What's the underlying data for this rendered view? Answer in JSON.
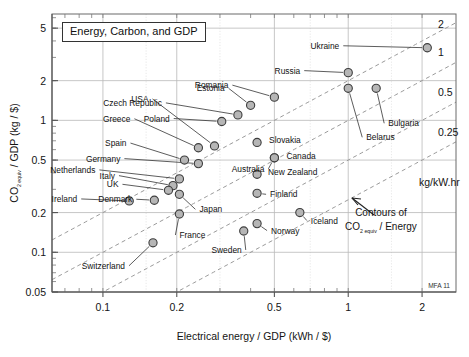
{
  "chart_data": {
    "type": "scatter",
    "title": "Energy, Carbon, and GDP",
    "xlabel": "Electrical energy / GDP (kWh / $)",
    "ylabel": "CO2 equiv / GDP (kg / $)",
    "xscale": "log",
    "yscale": "log",
    "xlim": [
      0.062,
      2.75
    ],
    "ylim": [
      0.05,
      6.4
    ],
    "xticks": [
      0.1,
      0.2,
      0.5,
      1,
      2
    ],
    "xticklabels": [
      "0.1",
      "0.2",
      "0.5",
      "1",
      "2"
    ],
    "yticks": [
      0.05,
      0.1,
      0.2,
      0.5,
      1,
      2,
      5
    ],
    "yticklabels": [
      "0.05",
      "0.1",
      "0.2",
      "0.5",
      "1",
      "2",
      "5"
    ],
    "grid": true,
    "legend": "none",
    "watermark": "MFA 11",
    "annotation": {
      "line1": "Contours of",
      "line2_pre": "CO",
      "line2_sub": "2 equiv",
      "line2_post": " / Energy"
    },
    "contours": {
      "unit_label": "kg/kW.hr",
      "levels": [
        2,
        1,
        0.5,
        0.25
      ],
      "level_labels": [
        "2",
        "1",
        "0.5",
        "0.25"
      ]
    },
    "points": [
      {
        "name": "Ukraine",
        "x": 2.1,
        "y": 3.55,
        "label_dx": -88,
        "label_dy": 1
      },
      {
        "name": "Russia",
        "x": 1.0,
        "y": 2.3,
        "label_dx": -48,
        "label_dy": 1
      },
      {
        "name": "Belarus",
        "x": 1.0,
        "y": 1.75,
        "label_dx": 18,
        "label_dy": 52
      },
      {
        "name": "Bulgaria",
        "x": 1.3,
        "y": 1.75,
        "label_dx": 12,
        "label_dy": 38
      },
      {
        "name": "Romania",
        "x": 0.5,
        "y": 1.5,
        "label_dx": -46,
        "label_dy": -9
      },
      {
        "name": "Estonia",
        "x": 0.4,
        "y": 1.3,
        "label_dx": -26,
        "label_dy": -14
      },
      {
        "name": "Czech Republic",
        "x": 0.355,
        "y": 1.1,
        "label_dx": -76,
        "label_dy": -9
      },
      {
        "name": "Poland",
        "x": 0.305,
        "y": 0.98,
        "label_dx": -52,
        "label_dy": 0
      },
      {
        "name": "Slovakia",
        "x": 0.425,
        "y": 0.68,
        "label_dx": 12,
        "label_dy": 1
      },
      {
        "name": "Greece",
        "x": 0.245,
        "y": 0.62,
        "label_dx": -68,
        "label_dy": -26
      },
      {
        "name": "USA",
        "x": 0.285,
        "y": 0.64,
        "label_dx": -66,
        "label_dy": -44
      },
      {
        "name": "Canada",
        "x": 0.5,
        "y": 0.52,
        "label_dx": 12,
        "label_dy": 1
      },
      {
        "name": "Australia",
        "x": 0.5,
        "y": 0.52,
        "label_dx": -10,
        "label_dy": 14
      },
      {
        "name": "Spain",
        "x": 0.215,
        "y": 0.5,
        "label_dx": -58,
        "label_dy": -14
      },
      {
        "name": "Germany",
        "x": 0.245,
        "y": 0.47,
        "label_dx": -78,
        "label_dy": -2
      },
      {
        "name": "New Zealand",
        "x": 0.425,
        "y": 0.39,
        "label_dx": 11,
        "label_dy": 1
      },
      {
        "name": "Netherlands",
        "x": 0.205,
        "y": 0.36,
        "label_dx": -84,
        "label_dy": -6
      },
      {
        "name": "Italy",
        "x": 0.193,
        "y": 0.32,
        "label_dx": -58,
        "label_dy": -7
      },
      {
        "name": "UK",
        "x": 0.185,
        "y": 0.295,
        "label_dx": -50,
        "label_dy": -3
      },
      {
        "name": "Japan",
        "x": 0.205,
        "y": 0.275,
        "label_dx": 20,
        "label_dy": 18
      },
      {
        "name": "Finland",
        "x": 0.425,
        "y": 0.28,
        "label_dx": 13,
        "label_dy": 4
      },
      {
        "name": "Ireland",
        "x": 0.128,
        "y": 0.245,
        "label_dx": -52,
        "label_dy": 1
      },
      {
        "name": "Denmark",
        "x": 0.162,
        "y": 0.248,
        "label_dx": -22,
        "label_dy": 2
      },
      {
        "name": "France",
        "x": 0.205,
        "y": 0.195,
        "label_dx": 0,
        "label_dy": 24
      },
      {
        "name": "Iceland",
        "x": 0.635,
        "y": 0.2,
        "label_dx": 11,
        "label_dy": 11
      },
      {
        "name": "Norway",
        "x": 0.425,
        "y": 0.165,
        "label_dx": 14,
        "label_dy": 10
      },
      {
        "name": "Sweden",
        "x": 0.375,
        "y": 0.145,
        "label_dx": -2,
        "label_dy": 22
      },
      {
        "name": "Switzerland",
        "x": 0.16,
        "y": 0.118,
        "label_dx": -28,
        "label_dy": 26
      }
    ]
  }
}
